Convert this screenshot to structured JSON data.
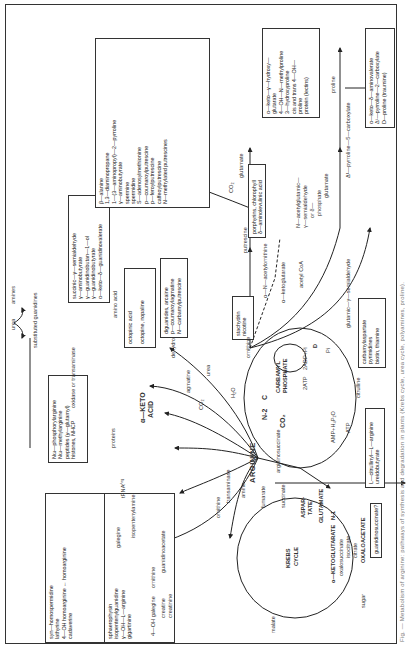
{
  "figure": {
    "caption": "Fig. — Metabolism of arginine: pathways of synthesis and degradation in plants (Krebs cycle, urea cycle, polyamines, proline).",
    "central_node": "ARGININE",
    "cycles": {
      "krebs": "KREBS\nCYCLE",
      "krebs_line1": "KREBS",
      "krebs_line2": "CYCLE"
    },
    "top_left_small": {
      "urea": "urea",
      "amines": "amines",
      "substituted_guanidines": "substituted guanidines"
    },
    "boxes": {
      "homoarginine": [
        "syn—homospermidine",
        "lathyrine",
        "4—OH homoarginine ← homoarginine",
        "cadaverine"
      ],
      "guanidines": [
        "sphaerophysin",
        "isopentenylguanidine",
        "galegine",
        "γ—OH—L—arginine",
        "gigartinine"
      ],
      "arginine_derivatives": [
        "Nω—phosphorylarginine",
        "Nω—methylarginine",
        "peptides (γ—glutamyl)",
        "histones, NHCP"
      ],
      "guanidino_acids": [
        "succinic—γ—semialdehyde",
        "γ—aminobutyrate",
        "γ—guanidinobutan—1—ol",
        "γ—guanidinobutyrate",
        "α—keto—δ—guanidinovalerate"
      ],
      "octopine": [
        "octopinic acid",
        "octopine, nopaline"
      ],
      "agmatine_products": [
        "diguanides, arcaine",
        "p—coumaroylagmatine",
        "N—carbamylputrescine"
      ],
      "stachydrin": [
        "stachydrin",
        "nicotine"
      ],
      "polyamines": [
        "β—alanine",
        "1,3—diaminopropane",
        "1—(3—aminopropyl)—2—pyrroline",
        "γ—aminobutyrate",
        "spermine",
        "spermidine",
        "S—adenosylmethionine",
        "p—coumaroylputrescine",
        "p—feroylputrescine",
        "caffeoylputrescine",
        "N—methylated putrescines"
      ],
      "porphyrins": [
        "porphyrins, chlorophyll",
        "δ—aminolevulinic acid"
      ],
      "hydroxyproline": [
        "α—keto—γ—hydroxy—",
        "glutarate",
        "4—OH—N—methylproline",
        "3—hydroxyproline",
        "cis and trans 4—OH—",
        "proline",
        "protein (lectins)"
      ],
      "carbamylaspartate": [
        "carbamylaspartate",
        "pyrimidines",
        "biotin, thiamine"
      ],
      "citrullinyl": [
        "L—citrullinyl—L—arginine",
        "ureidobutyrate"
      ],
      "guanidinosuccinate": [
        "guanidinosuccinate?"
      ],
      "proline_products": [
        "α—keto—δ—aminovalerate",
        "Δ¹—pyrroline—2—carboxylate",
        "D—proline (traumine)"
      ]
    },
    "labels": {
      "proteins": "proteins",
      "keto_acid": "α—KETO\nACID",
      "keto_acid_l1": "α—KETO",
      "keto_acid_l2": "ACID",
      "trna": "tRNAᴬʳᵍ",
      "oxidase_transaminase": "oxidase or transaminase",
      "amino_acid": "amino acid",
      "dehydrogenase": "dehydrogenase",
      "co2_1": "CO₂",
      "agmatine": "agmatine",
      "urea2": "urea",
      "h2o": "H₂O",
      "ornithine": "ornithine",
      "putrescine": "putrescine",
      "co2_2": "CO₂",
      "glutamate1": "glutamate",
      "alpha_n_acetylornithine": "α—N—acetylornithine",
      "alpha_ketoglutarate": "α—ketoglutarate",
      "acetyl_coa": "acetyl CoA",
      "n_acetylglutamic": "N—acetylglutamic—",
      "gamma_semialdehyde": "γ—semialdehyde",
      "or_delta": "or δ—",
      "phosphate": "phosphate",
      "glutamate2": "glutamate",
      "glutamic_semialdehyde": "glutamic—γ—semialdehyde",
      "pyrroline_carboxylate": "Δ¹—pyrroline—5—carboxylate",
      "proline": "proline",
      "n2": "N-2",
      "c": "C",
      "carbamyl_phosphate": "CARBAMYL\nPHOSPHATE",
      "carbamyl_l1": "CARBAMYL",
      "carbamyl_l2": "PHOSPHATE",
      "atp2": "2ATP",
      "adp_pi": "2ADP+Pi",
      "pi": "Pi",
      "d": "D",
      "co2_3": "CO₂",
      "citrulline": "citrulline",
      "amp": "AMP+H₄P₂O",
      "atp": "ATP",
      "argininosuccinate": "argininosuccinate",
      "fumarate": "fumarate",
      "succinate": "succinate",
      "aspartate": "ASPAR-\nTATE",
      "aspar_l1": "ASPAR-",
      "aspar_l2": "TATE",
      "glutamate3": "GLUTAMATE",
      "n1": "N-1",
      "ketoglutarate": "α—KETOGLUTARATE",
      "oxalosuccinate": "oxalosuccinate",
      "isocitrate": "isocitrate",
      "citrate": "citrate",
      "oxaloacetate": "OXALOACETATE",
      "sugar": "sugar",
      "malate": "malate",
      "amine": "amine",
      "transaminase": "transaminase",
      "ornithine2": "ornithine",
      "galegine": "galegine",
      "isopentenylamine": "isopentenylamine",
      "guanidinoacetate": "guanidinoacetate",
      "ornithine3": "ornithine",
      "glycine": "glycine",
      "oh_galegine": "4—OH galegine",
      "creatine": "creatine",
      "creatinine": "creatinine",
      "dimethylallylguanidine": "dimethylallylguanidine",
      "spermine": "spermine",
      "oxidase": "oxidase",
      "enzyme_a": "A",
      "enzyme_b": "B",
      "enzyme_b2": "B"
    }
  }
}
